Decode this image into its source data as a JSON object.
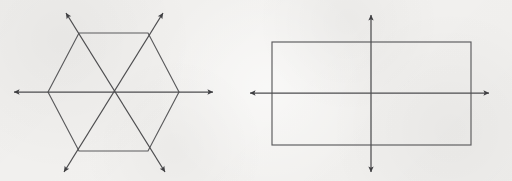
{
  "page": {
    "width": 512,
    "height": 181,
    "background_color": "#f1f0ee",
    "stroke_color": "#5a5a5c",
    "axis_color": "#4d4d4f",
    "arrow_color": "#3f3f42"
  },
  "figures": [
    {
      "id": "hexagon-figure",
      "shape": "regular-hexagon",
      "label": "hexagon with three lines of symmetry",
      "center": {
        "x": 113.5,
        "y": 92
      },
      "vertices": [
        {
          "name": "left",
          "x": 48,
          "y": 92
        },
        {
          "name": "top-left",
          "x": 79,
          "y": 33
        },
        {
          "name": "top-right",
          "x": 148,
          "y": 33
        },
        {
          "name": "right",
          "x": 179,
          "y": 92
        },
        {
          "name": "bottom-right",
          "x": 148,
          "y": 151
        },
        {
          "name": "bottom-left",
          "x": 79,
          "y": 151
        }
      ],
      "polygon_points": "48,92 79,33 148,33 179,92 148,151 79,151",
      "symmetry_axis_count": 3,
      "symmetry_axes": [
        {
          "name": "horizontal-axis",
          "orientation": "horizontal",
          "x1": 14,
          "y1": 92,
          "x2": 213,
          "y2": 92,
          "double_headed": true
        },
        {
          "name": "diagonal-axis-up-right",
          "orientation": "diagonal-up-right",
          "x1": 64,
          "y1": 172,
          "x2": 163,
          "y2": 13,
          "double_headed": true
        },
        {
          "name": "diagonal-axis-down-right",
          "orientation": "diagonal-down-right",
          "x1": 66,
          "y1": 13,
          "x2": 165,
          "y2": 172,
          "double_headed": true
        }
      ]
    },
    {
      "id": "rectangle-figure",
      "shape": "rectangle",
      "label": "rectangle with two lines of symmetry",
      "rect": {
        "x": 272,
        "y": 42,
        "width": 199,
        "height": 103
      },
      "corners": [
        {
          "name": "top-left",
          "x": 272,
          "y": 42
        },
        {
          "name": "top-right",
          "x": 471,
          "y": 42
        },
        {
          "name": "bottom-right",
          "x": 471,
          "y": 145
        },
        {
          "name": "bottom-left",
          "x": 272,
          "y": 145
        }
      ],
      "center": {
        "x": 371.5,
        "y": 93.5
      },
      "symmetry_axis_count": 2,
      "symmetry_axes": [
        {
          "name": "horizontal-axis",
          "orientation": "horizontal",
          "x1": 250,
          "y1": 93,
          "x2": 489,
          "y2": 93,
          "double_headed": true
        },
        {
          "name": "vertical-axis",
          "orientation": "vertical",
          "x1": 371,
          "y1": 15,
          "x2": 371,
          "y2": 172,
          "double_headed": true
        }
      ]
    }
  ]
}
